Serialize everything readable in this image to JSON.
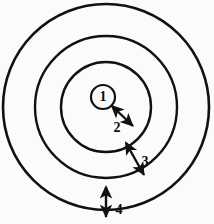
{
  "figure": {
    "background_color": "#fbfbfb",
    "stroke_color": "#111111",
    "width": 214,
    "height": 224,
    "center": {
      "x": 106,
      "y": 107
    }
  },
  "chart_data": {
    "type": "diagram",
    "title": "",
    "subtitle": "",
    "xlabel": "",
    "ylabel": "",
    "rings": [
      {
        "id": 1,
        "label": "1",
        "cx": 103,
        "cy": 97,
        "r": 12,
        "stroke_width": 2.2,
        "note": "innermost labelled circle"
      },
      {
        "id": 2,
        "label": "",
        "cx": 106,
        "cy": 107,
        "r": 45,
        "stroke_width": 2.4,
        "note": "second ring"
      },
      {
        "id": 3,
        "label": "",
        "cx": 106,
        "cy": 107,
        "r": 71,
        "stroke_width": 2.4,
        "note": "third ring"
      },
      {
        "id": 4,
        "label": "",
        "cx": 106,
        "cy": 107,
        "r": 103,
        "stroke_width": 2.6,
        "note": "outermost ring"
      }
    ],
    "annotations": [
      {
        "label": "1",
        "kind": "circle-label",
        "x": 103,
        "y": 97
      },
      {
        "label": "2",
        "kind": "gap-arrow",
        "from": {
          "x": 112,
          "y": 106
        },
        "to": {
          "x": 133,
          "y": 126
        },
        "label_x": 117,
        "label_y": 128,
        "double_headed": true
      },
      {
        "label": "3",
        "kind": "gap-arrow",
        "from": {
          "x": 126,
          "y": 143
        },
        "to": {
          "x": 144,
          "y": 175
        },
        "label_x": 145,
        "label_y": 162,
        "double_headed": true
      },
      {
        "label": "4",
        "kind": "gap-arrow",
        "from": {
          "x": 106,
          "y": 187
        },
        "to": {
          "x": 106,
          "y": 217
        },
        "label_x": 119,
        "label_y": 210,
        "double_headed": true
      }
    ],
    "grid": false,
    "legend": null
  }
}
